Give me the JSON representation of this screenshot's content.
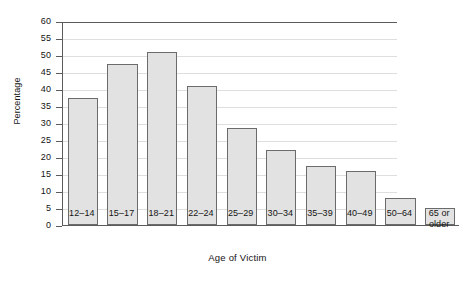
{
  "chart_data": {
    "type": "bar",
    "title": "",
    "subtitle": "",
    "xlabel": "Age of Victim",
    "ylabel": "Percentage",
    "categories": [
      "12–14",
      "15–17",
      "18–21",
      "22–24",
      "25–29",
      "30–34",
      "35–39",
      "40–49",
      "50–64",
      "65 or older"
    ],
    "category_lines": [
      [
        "12–14"
      ],
      [
        "15–17"
      ],
      [
        "18–21"
      ],
      [
        "22–24"
      ],
      [
        "25–29"
      ],
      [
        "30–34"
      ],
      [
        "35–39"
      ],
      [
        "40–49"
      ],
      [
        "50–64"
      ],
      [
        "65 or",
        "older"
      ]
    ],
    "values": [
      37.5,
      47.5,
      51,
      41,
      28.5,
      22,
      17.5,
      16,
      8,
      5
    ],
    "ylim": [
      0,
      60
    ],
    "ytick_step": 5,
    "yticks": [
      0,
      5,
      10,
      15,
      20,
      25,
      30,
      35,
      40,
      45,
      50,
      55,
      60
    ],
    "ytick_labels": [
      "0",
      "5",
      "10",
      "15",
      "20",
      "25",
      "30",
      "35",
      "40",
      "45",
      "50",
      "55",
      "60"
    ],
    "grid": true,
    "grid_axis": "y",
    "legend": false,
    "legend_position": "none",
    "bar_fill": "#e2e2e2",
    "bar_edge": "#6b6b6b",
    "axis_color": "#5c5c5c",
    "grid_color": "#dedede",
    "background": "#ffffff"
  }
}
